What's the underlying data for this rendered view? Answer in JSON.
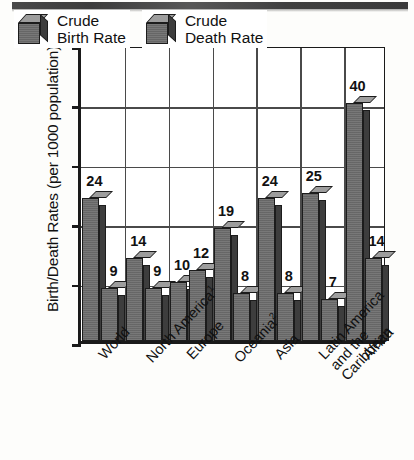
{
  "chart_data": {
    "type": "bar",
    "title": "",
    "xlabel": "",
    "ylabel": "Birth/Death Rates (per 1000 population)",
    "ylim": [
      0,
      50
    ],
    "yticks": [
      0,
      10,
      20,
      30,
      40,
      50
    ],
    "grid": true,
    "legend_position": "upper-left-inside",
    "categories": [
      "World",
      "North America¹",
      "Europe",
      "Oceania²",
      "Asia",
      "Latin America and the Caribbean",
      "Africa"
    ],
    "category_lines": [
      [
        "World"
      ],
      [
        "North America¹"
      ],
      [
        "Europe"
      ],
      [
        "Oceania²"
      ],
      [
        "Asia"
      ],
      [
        "Latin America",
        "and the",
        "Caribbean"
      ],
      [
        "Africa"
      ]
    ],
    "series": [
      {
        "name": "Crude Birth Rate",
        "values": [
          24,
          14,
          10,
          19,
          24,
          25,
          40
        ]
      },
      {
        "name": "Crude Death Rate",
        "values": [
          9,
          9,
          12,
          8,
          8,
          7,
          14
        ]
      }
    ]
  },
  "legend": {
    "items": [
      {
        "lines": [
          "Crude",
          "Birth Rate"
        ],
        "icon": "cube-icon"
      },
      {
        "lines": [
          "Crude",
          "Death Rate"
        ],
        "icon": "cube-icon"
      }
    ]
  },
  "colors": {
    "bar_front": "#6e6e6e",
    "bar_top": "#9d9d9d",
    "bar_side": "#3d3d3d",
    "axis": "#1a1a1a",
    "grid": "#4a4a4a",
    "background": "#fdfdfb"
  }
}
